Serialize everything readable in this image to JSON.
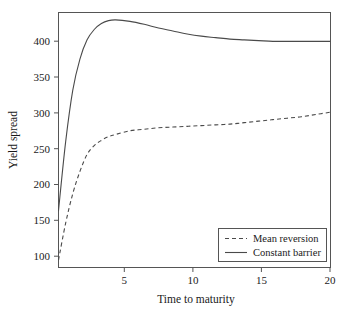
{
  "chart_data": {
    "type": "line",
    "title": "",
    "xlabel": "Time to maturity",
    "ylabel": "Yield spread",
    "xlim": [
      1,
      20
    ],
    "ylim": [
      90,
      435
    ],
    "grid": false,
    "legend_position": "bottom-right",
    "xticks": [
      5,
      10,
      15,
      20
    ],
    "xtick_labels": [
      "5",
      "10",
      "15",
      "20"
    ],
    "yticks": [
      100,
      150,
      200,
      250,
      300,
      350,
      400
    ],
    "ytick_labels": [
      "100",
      "150",
      "200",
      "250",
      "300",
      "350",
      "400"
    ],
    "x": [
      1,
      1.5,
      2,
      2.5,
      3,
      3.5,
      4,
      4.5,
      5,
      6,
      7,
      8,
      9,
      10,
      11,
      12,
      13,
      14,
      15,
      16,
      17,
      18,
      19,
      20
    ],
    "series": [
      {
        "name": "Mean reversion",
        "style": "dashed",
        "color": "#4a4a4a",
        "values": [
          100,
          150,
          190,
          220,
          243,
          255,
          262,
          267,
          270,
          275,
          277,
          279,
          280,
          281,
          282,
          283,
          284,
          286,
          288,
          290,
          292,
          294,
          297,
          300
        ]
      },
      {
        "name": "Constant barrier",
        "style": "solid",
        "color": "#4a4a4a",
        "values": [
          167,
          260,
          330,
          372,
          398,
          412,
          420,
          424,
          425,
          423,
          419,
          414,
          410,
          406,
          403,
          401,
          399,
          398,
          397,
          396,
          396,
          396,
          396,
          396
        ]
      }
    ]
  },
  "legend": {
    "entries": [
      {
        "label": "Mean reversion",
        "style": "dashed"
      },
      {
        "label": "Constant barrier",
        "style": "solid"
      }
    ]
  },
  "axes": {
    "x_title": "Time to maturity",
    "y_title": "Yield spread"
  }
}
